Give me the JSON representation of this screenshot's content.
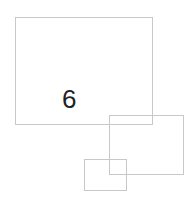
{
  "diagram": {
    "stroke_color": "#c8c8c8",
    "text_color": "#222222",
    "boxes": [
      {
        "name": "large-rectangle",
        "x": 15,
        "y": 17,
        "w": 138,
        "h": 108
      },
      {
        "name": "medium-rectangle",
        "x": 109,
        "y": 115,
        "w": 75,
        "h": 60
      },
      {
        "name": "small-rectangle",
        "x": 84,
        "y": 159,
        "w": 43,
        "h": 32
      }
    ],
    "label": "6"
  }
}
